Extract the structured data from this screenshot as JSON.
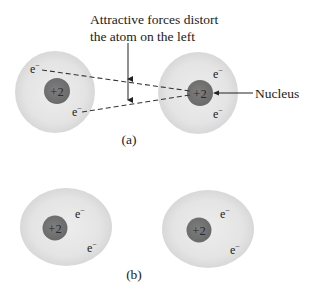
{
  "annotation": {
    "line1": "Attractive forces distort",
    "line2": "the atom on the left"
  },
  "nucleus_label": "Nucleus",
  "panels": [
    {
      "caption": "(a)",
      "atoms": [
        {
          "charge": "+2",
          "electrons": [
            "e",
            "e"
          ],
          "electron_sup": "−"
        },
        {
          "charge": "+2",
          "electrons": [
            "e",
            "e"
          ],
          "electron_sup": "−"
        }
      ]
    },
    {
      "caption": "(b)",
      "atoms": [
        {
          "charge": "+2",
          "electrons": [
            "e",
            "e"
          ],
          "electron_sup": "−"
        },
        {
          "charge": "+2",
          "electrons": [
            "e",
            "e"
          ],
          "electron_sup": "−"
        }
      ]
    }
  ],
  "colors": {
    "cloud": "#e4e4e4",
    "cloud_edge": "#d6d6d6",
    "nucleus": "#757575",
    "line": "#333333"
  }
}
